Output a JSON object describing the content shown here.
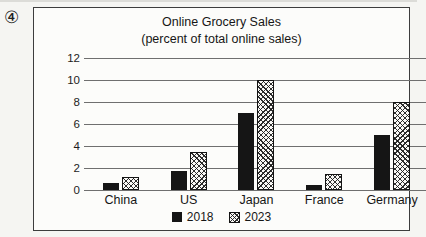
{
  "figure_label": "④",
  "chart_data": {
    "type": "bar",
    "title": "Online Grocery Sales",
    "subtitle": "(percent of total online sales)",
    "categories": [
      "China",
      "US",
      "Japan",
      "France",
      "Germany"
    ],
    "series": [
      {
        "name": "2018",
        "pattern": "solid",
        "color": "#151515",
        "values": [
          0.6,
          1.7,
          7,
          0.5,
          5
        ]
      },
      {
        "name": "2023",
        "pattern": "crosshatch",
        "color": "#151515",
        "values": [
          1.2,
          3.5,
          10,
          1.5,
          8
        ]
      }
    ],
    "xlabel": "",
    "ylabel": "",
    "ylim": [
      0,
      12
    ],
    "yticks": [
      12,
      10,
      8,
      6,
      4,
      2,
      0
    ],
    "grid": true,
    "legend_position": "bottom-center"
  }
}
